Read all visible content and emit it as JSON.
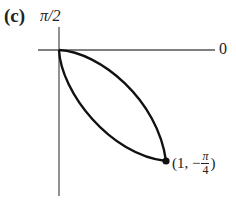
{
  "figure": {
    "panel_label": "(c)",
    "axis_labels": {
      "vertical_top": "π/2",
      "horizontal_right": "0"
    },
    "point_label": {
      "open": "(1, −",
      "frac_num": "π",
      "frac_den": "4",
      "close": ")"
    },
    "curve": {
      "description": "closed petal loop from pole to point (1, −π/4)",
      "endpoint": {
        "r": 1,
        "theta": "−π/4"
      }
    },
    "colors": {
      "axis": "#555555",
      "curve": "#111111",
      "text": "#222222",
      "background": "#ffffff"
    }
  }
}
